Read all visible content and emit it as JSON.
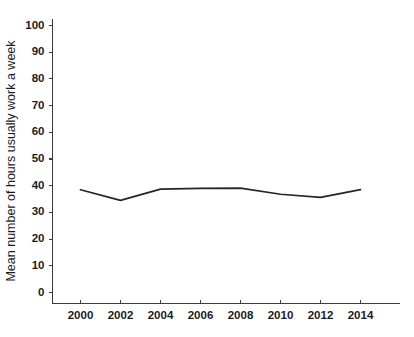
{
  "chart_data": {
    "type": "line",
    "title": "",
    "xlabel": "",
    "ylabel": "Mean number of hours usually work a week",
    "x": [
      2000,
      2002,
      2004,
      2006,
      2008,
      2010,
      2012,
      2014
    ],
    "xticklabels": [
      "2000",
      "2002",
      "2004",
      "2006",
      "2008",
      "2010",
      "2012",
      "2014"
    ],
    "yticklabels": [
      "0",
      "10",
      "20",
      "30",
      "40",
      "50",
      "60",
      "70",
      "80",
      "90",
      "100"
    ],
    "yticks": [
      0,
      10,
      20,
      30,
      40,
      50,
      60,
      70,
      80,
      90,
      100
    ],
    "xlim": [
      1999,
      2015
    ],
    "ylim": [
      0,
      100
    ],
    "grid": false,
    "legend": null,
    "series": [
      {
        "name": "Mean weekly work hours",
        "color": "#262626",
        "values": [
          38.5,
          34.5,
          38.7,
          39.0,
          39.1,
          36.8,
          35.6,
          38.5
        ]
      }
    ]
  }
}
